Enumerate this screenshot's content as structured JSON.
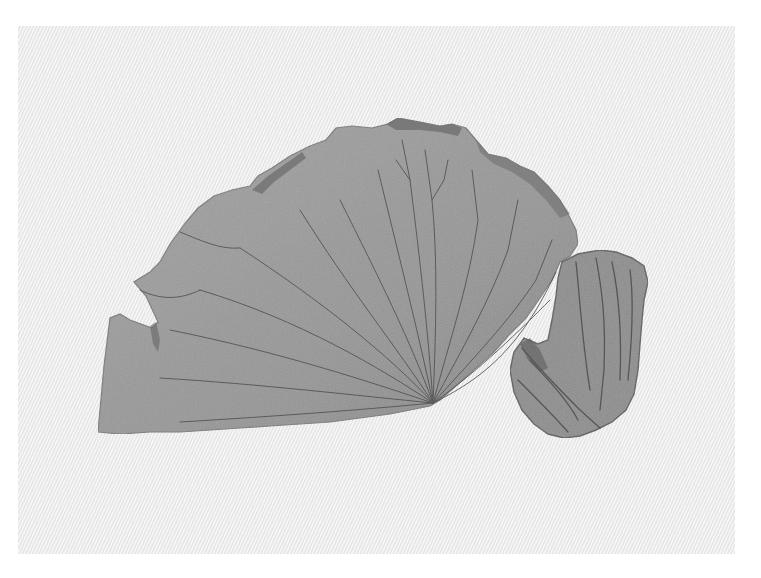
{
  "image": {
    "subject": "Dried lotus leaf fragment and curled leaf piece on textured paper",
    "width": 761,
    "height": 578
  },
  "colors": {
    "background": "#ffffff",
    "paper": "#ececec",
    "leaf_fill": "#9a9a9a",
    "leaf_edge": "#6f6f6f",
    "vein": "#4a4a4a",
    "curled_leaf": "#8c8c8c"
  },
  "objects": [
    {
      "name": "textured-paper",
      "bbox": [
        18,
        26,
        717,
        528
      ]
    },
    {
      "name": "lotus-leaf-fragment",
      "bbox": [
        97,
        118,
        485,
        320
      ],
      "vein_hub": [
        433,
        403
      ]
    },
    {
      "name": "curled-leaf-piece",
      "bbox": [
        508,
        250,
        142,
        190
      ]
    }
  ]
}
